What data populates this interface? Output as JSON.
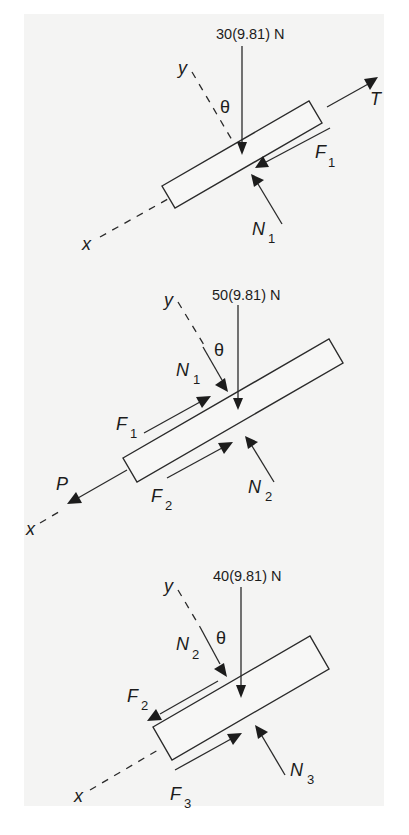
{
  "diagrams": [
    {
      "id": "block-1",
      "weight_label": "30(9.81) N",
      "angle_label": "θ",
      "axis_x": "x",
      "axis_y": "y",
      "forces": [
        {
          "name": "T",
          "sub": ""
        },
        {
          "name": "F",
          "sub": "1"
        },
        {
          "name": "N",
          "sub": "1"
        }
      ]
    },
    {
      "id": "block-2",
      "weight_label": "50(9.81) N",
      "angle_label": "θ",
      "axis_x": "x",
      "axis_y": "y",
      "forces": [
        {
          "name": "N",
          "sub": "1"
        },
        {
          "name": "F",
          "sub": "1"
        },
        {
          "name": "P",
          "sub": ""
        },
        {
          "name": "F",
          "sub": "2"
        },
        {
          "name": "N",
          "sub": "2"
        }
      ]
    },
    {
      "id": "block-3",
      "weight_label": "40(9.81) N",
      "angle_label": "θ",
      "axis_x": "x",
      "axis_y": "y",
      "forces": [
        {
          "name": "N",
          "sub": "2"
        },
        {
          "name": "F",
          "sub": "2"
        },
        {
          "name": "F",
          "sub": "3"
        },
        {
          "name": "N",
          "sub": "3"
        }
      ]
    }
  ],
  "colors": {
    "ink": "#1c1c1c",
    "panel": "#f4f4f3",
    "background": "#ffffff"
  }
}
